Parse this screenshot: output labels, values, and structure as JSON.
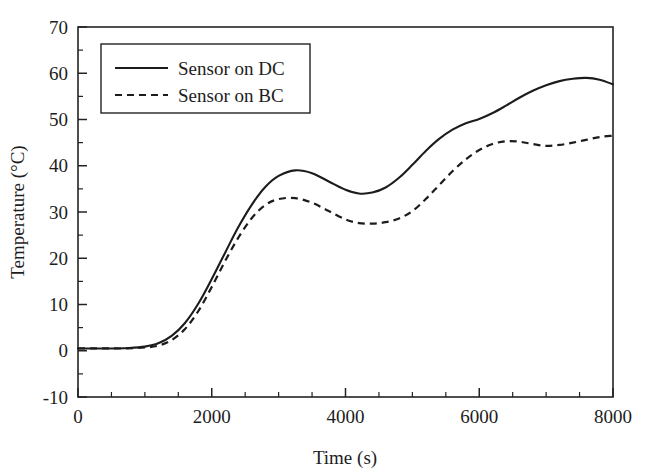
{
  "chart_data": {
    "type": "line",
    "title": "",
    "xlabel": "Time (s)",
    "ylabel": "Temperature (°C)",
    "xlim": [
      0,
      8000
    ],
    "ylim": [
      -10,
      70
    ],
    "xticks": [
      0,
      2000,
      4000,
      6000,
      8000
    ],
    "xtick_labels": [
      "0",
      "2000",
      "4000",
      "6000",
      "8000"
    ],
    "x_minor_tick_interval": 500,
    "yticks": [
      -10,
      0,
      10,
      20,
      30,
      40,
      50,
      60,
      70
    ],
    "ytick_labels": [
      "-10",
      "0",
      "10",
      "20",
      "30",
      "40",
      "50",
      "60",
      "70"
    ],
    "y_minor_tick_interval": 5,
    "grid": false,
    "legend_position": "upper left",
    "line_color": "#1c1c1c",
    "background_color": "#ffffff",
    "x": [
      0,
      250,
      500,
      750,
      1000,
      1200,
      1400,
      1600,
      1800,
      2000,
      2200,
      2400,
      2600,
      2800,
      3000,
      3250,
      3500,
      3750,
      4000,
      4200,
      4400,
      4600,
      4800,
      5000,
      5200,
      5400,
      5600,
      5800,
      6000,
      6200,
      6400,
      6600,
      6800,
      7000,
      7200,
      7400,
      7600,
      7800,
      8000
    ],
    "series": [
      {
        "name": "Sensor on DC",
        "style": "solid",
        "values": [
          0.5,
          0.5,
          0.5,
          0.6,
          0.9,
          1.6,
          3.2,
          6.0,
          10.2,
          15.5,
          21.2,
          26.8,
          31.6,
          35.4,
          37.8,
          39.0,
          38.4,
          36.6,
          34.8,
          34.0,
          34.2,
          35.3,
          37.4,
          40.2,
          43.2,
          45.8,
          47.8,
          49.2,
          50.1,
          51.4,
          53.0,
          54.7,
          56.2,
          57.4,
          58.3,
          58.8,
          59.0,
          58.6,
          57.6
        ]
      },
      {
        "name": "Sensor on BC",
        "style": "dashed",
        "values": [
          0.5,
          0.5,
          0.5,
          0.5,
          0.7,
          1.1,
          2.3,
          4.7,
          8.6,
          13.8,
          19.4,
          24.5,
          28.7,
          31.5,
          32.8,
          33.0,
          32.0,
          30.2,
          28.4,
          27.6,
          27.5,
          27.8,
          28.6,
          30.2,
          32.8,
          35.8,
          38.8,
          41.4,
          43.4,
          44.7,
          45.3,
          45.2,
          44.7,
          44.3,
          44.5,
          45.0,
          45.6,
          46.2,
          46.5
        ]
      }
    ]
  },
  "legend": {
    "entries": [
      {
        "label": "Sensor on DC",
        "style": "solid"
      },
      {
        "label": "Sensor on BC",
        "style": "dashed"
      }
    ]
  },
  "axes": {
    "x_title": "Time (s)",
    "y_title": "Temperature (°C)"
  }
}
